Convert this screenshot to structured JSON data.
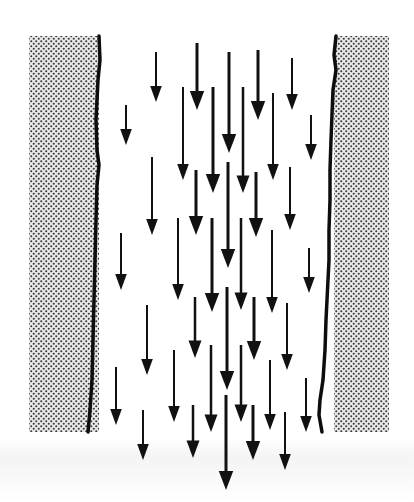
{
  "diagram": {
    "type": "channel-flow",
    "colors": {
      "background": "#ffffff",
      "arrow": "#111111",
      "wall_edge": "#0d0d0d",
      "wall_dot": "#3a3a3a",
      "wall_fill": "#e6e6e6"
    },
    "walls": [
      {
        "name": "left-wall",
        "x": 29,
        "y": 36,
        "width": 70,
        "height": 396,
        "edge_side": "right"
      },
      {
        "name": "right-wall",
        "x": 334,
        "y": 36,
        "width": 55,
        "height": 396,
        "edge_side": "left"
      }
    ],
    "arrows": [
      {
        "x": 126,
        "y1": 105,
        "y2": 145,
        "w": 2
      },
      {
        "x": 156,
        "y1": 52,
        "y2": 102,
        "w": 2
      },
      {
        "x": 152,
        "y1": 157,
        "y2": 235,
        "w": 2
      },
      {
        "x": 121,
        "y1": 233,
        "y2": 290,
        "w": 2
      },
      {
        "x": 147,
        "y1": 305,
        "y2": 375,
        "w": 2
      },
      {
        "x": 116,
        "y1": 367,
        "y2": 425,
        "w": 2
      },
      {
        "x": 143,
        "y1": 410,
        "y2": 460,
        "w": 2
      },
      {
        "x": 197,
        "y1": 43,
        "y2": 110,
        "w": 3
      },
      {
        "x": 183,
        "y1": 87,
        "y2": 180,
        "w": 2
      },
      {
        "x": 213,
        "y1": 87,
        "y2": 193,
        "w": 3
      },
      {
        "x": 229,
        "y1": 52,
        "y2": 153,
        "w": 3
      },
      {
        "x": 243,
        "y1": 87,
        "y2": 193,
        "w": 2.5
      },
      {
        "x": 196,
        "y1": 170,
        "y2": 235,
        "w": 3
      },
      {
        "x": 228,
        "y1": 162,
        "y2": 268,
        "w": 3
      },
      {
        "x": 178,
        "y1": 218,
        "y2": 300,
        "w": 2
      },
      {
        "x": 212,
        "y1": 218,
        "y2": 312,
        "w": 3
      },
      {
        "x": 241,
        "y1": 218,
        "y2": 310,
        "w": 2.5
      },
      {
        "x": 195,
        "y1": 297,
        "y2": 358,
        "w": 2.5
      },
      {
        "x": 227,
        "y1": 287,
        "y2": 390,
        "w": 3
      },
      {
        "x": 174,
        "y1": 350,
        "y2": 422,
        "w": 2
      },
      {
        "x": 211,
        "y1": 345,
        "y2": 432,
        "w": 2.5
      },
      {
        "x": 241,
        "y1": 345,
        "y2": 422,
        "w": 2.5
      },
      {
        "x": 193,
        "y1": 405,
        "y2": 458,
        "w": 2.5
      },
      {
        "x": 226,
        "y1": 395,
        "y2": 490,
        "w": 3
      },
      {
        "x": 258,
        "y1": 50,
        "y2": 120,
        "w": 3
      },
      {
        "x": 292,
        "y1": 58,
        "y2": 110,
        "w": 2
      },
      {
        "x": 273,
        "y1": 93,
        "y2": 180,
        "w": 2
      },
      {
        "x": 311,
        "y1": 115,
        "y2": 160,
        "w": 2
      },
      {
        "x": 256,
        "y1": 172,
        "y2": 237,
        "w": 3
      },
      {
        "x": 290,
        "y1": 167,
        "y2": 230,
        "w": 2
      },
      {
        "x": 272,
        "y1": 230,
        "y2": 313,
        "w": 2
      },
      {
        "x": 309,
        "y1": 248,
        "y2": 293,
        "w": 2
      },
      {
        "x": 254,
        "y1": 297,
        "y2": 360,
        "w": 3
      },
      {
        "x": 287,
        "y1": 303,
        "y2": 370,
        "w": 2
      },
      {
        "x": 270,
        "y1": 360,
        "y2": 430,
        "w": 2
      },
      {
        "x": 306,
        "y1": 378,
        "y2": 432,
        "w": 2
      },
      {
        "x": 253,
        "y1": 405,
        "y2": 460,
        "w": 3
      },
      {
        "x": 285,
        "y1": 412,
        "y2": 470,
        "w": 2
      }
    ]
  }
}
